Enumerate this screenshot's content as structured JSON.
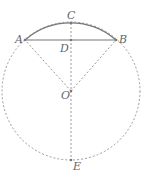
{
  "diagram": {
    "labels": {
      "A": "A",
      "B": "B",
      "C": "C",
      "D": "D",
      "O": "O",
      "E": "E"
    },
    "colors": {
      "solid": "#777777",
      "dashed": "#999999",
      "text": "#666666"
    }
  }
}
